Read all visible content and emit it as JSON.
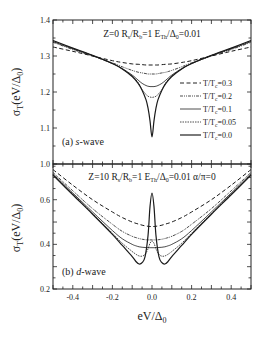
{
  "chart_data": [
    {
      "type": "line",
      "panel_label": "(a) s-wave",
      "annotation": "Z=0  Rs/Rb=1  ETh/Δ0=0.01",
      "xlabel": "eV/Δ0",
      "ylabel": "σT(eV/Δ0)",
      "xlim": [
        -0.5,
        0.5
      ],
      "ylim": [
        1.0,
        1.4
      ],
      "yticks": [
        "1.0",
        "1.1",
        "1.2",
        "1.3",
        "1.4"
      ],
      "grid": false,
      "legend_position": "right-center",
      "x": [
        -0.5,
        -0.4,
        -0.3,
        -0.2,
        -0.15,
        -0.1,
        -0.07,
        -0.05,
        -0.03,
        -0.02,
        -0.01,
        0.0,
        0.01,
        0.02,
        0.03,
        0.05,
        0.07,
        0.1,
        0.15,
        0.2,
        0.3,
        0.4,
        0.5
      ],
      "series": [
        {
          "name": "T/Tc=0.3",
          "style": "dashed",
          "values": [
            1.325,
            1.313,
            1.3,
            1.287,
            1.282,
            1.278,
            1.277,
            1.276,
            1.275,
            1.275,
            1.275,
            1.275,
            1.275,
            1.275,
            1.275,
            1.276,
            1.277,
            1.278,
            1.282,
            1.287,
            1.3,
            1.313,
            1.325
          ]
        },
        {
          "name": "T/Tc=0.2",
          "style": "dash-dot-dot",
          "values": [
            1.338,
            1.318,
            1.3,
            1.281,
            1.27,
            1.26,
            1.255,
            1.253,
            1.251,
            1.25,
            1.25,
            1.25,
            1.25,
            1.25,
            1.251,
            1.253,
            1.255,
            1.26,
            1.27,
            1.281,
            1.3,
            1.318,
            1.338
          ]
        },
        {
          "name": "T/Tc=0.1",
          "style": "solid-thin",
          "values": [
            1.34,
            1.32,
            1.301,
            1.279,
            1.265,
            1.247,
            1.233,
            1.224,
            1.218,
            1.216,
            1.215,
            1.215,
            1.215,
            1.216,
            1.218,
            1.224,
            1.233,
            1.247,
            1.265,
            1.279,
            1.301,
            1.32,
            1.34
          ]
        },
        {
          "name": "T/Tc=0.05",
          "style": "short-dash",
          "values": [
            1.342,
            1.321,
            1.301,
            1.279,
            1.264,
            1.244,
            1.226,
            1.207,
            1.193,
            1.188,
            1.186,
            1.185,
            1.186,
            1.188,
            1.193,
            1.207,
            1.226,
            1.244,
            1.264,
            1.279,
            1.301,
            1.321,
            1.342
          ]
        },
        {
          "name": "T/Tc=0.0",
          "style": "solid",
          "values": [
            1.343,
            1.322,
            1.302,
            1.279,
            1.264,
            1.243,
            1.224,
            1.205,
            1.178,
            1.155,
            1.12,
            1.075,
            1.12,
            1.155,
            1.178,
            1.205,
            1.224,
            1.243,
            1.264,
            1.279,
            1.302,
            1.322,
            1.343
          ]
        }
      ]
    },
    {
      "type": "line",
      "panel_label": "(b) d-wave",
      "annotation": "Z=10  Rs/Rb=1  ETh/Δ0=0.01  α/π=0",
      "xlabel": "eV/Δ0",
      "ylabel": "σT(eV/Δ0)",
      "xlim": [
        -0.5,
        0.5
      ],
      "ylim": [
        0.2,
        0.76
      ],
      "xticks": [
        "-0.4",
        "-0.2",
        "0.0",
        "0.2",
        "0.4"
      ],
      "yticks": [
        "0.2",
        "0.4",
        "0.6"
      ],
      "grid": false,
      "x": [
        -0.5,
        -0.4,
        -0.3,
        -0.2,
        -0.15,
        -0.1,
        -0.08,
        -0.065,
        -0.05,
        -0.035,
        -0.02,
        -0.01,
        0.0,
        0.01,
        0.02,
        0.035,
        0.05,
        0.065,
        0.08,
        0.1,
        0.15,
        0.2,
        0.3,
        0.4,
        0.5
      ],
      "series": [
        {
          "name": "T/Tc=0.3",
          "style": "dashed",
          "values": [
            0.735,
            0.665,
            0.6,
            0.545,
            0.52,
            0.5,
            0.494,
            0.49,
            0.486,
            0.483,
            0.481,
            0.48,
            0.48,
            0.48,
            0.481,
            0.483,
            0.486,
            0.49,
            0.494,
            0.5,
            0.52,
            0.545,
            0.6,
            0.665,
            0.735
          ]
        },
        {
          "name": "T/Tc=0.2",
          "style": "dash-dot-dot",
          "values": [
            0.722,
            0.64,
            0.56,
            0.49,
            0.458,
            0.436,
            0.43,
            0.426,
            0.423,
            0.421,
            0.42,
            0.42,
            0.42,
            0.42,
            0.42,
            0.421,
            0.423,
            0.426,
            0.43,
            0.436,
            0.458,
            0.49,
            0.56,
            0.64,
            0.722
          ]
        },
        {
          "name": "T/Tc=0.1",
          "style": "solid-thin",
          "values": [
            0.716,
            0.63,
            0.545,
            0.462,
            0.425,
            0.4,
            0.393,
            0.389,
            0.387,
            0.386,
            0.385,
            0.385,
            0.385,
            0.385,
            0.385,
            0.386,
            0.387,
            0.389,
            0.393,
            0.4,
            0.425,
            0.462,
            0.545,
            0.63,
            0.716
          ]
        },
        {
          "name": "T/Tc=0.05",
          "style": "short-dash",
          "values": [
            0.712,
            0.625,
            0.538,
            0.45,
            0.405,
            0.368,
            0.355,
            0.348,
            0.347,
            0.355,
            0.38,
            0.405,
            0.415,
            0.405,
            0.38,
            0.355,
            0.347,
            0.348,
            0.355,
            0.368,
            0.405,
            0.45,
            0.538,
            0.625,
            0.712
          ]
        },
        {
          "name": "T/Tc=0.0",
          "style": "solid",
          "values": [
            0.71,
            0.622,
            0.535,
            0.445,
            0.395,
            0.345,
            0.322,
            0.312,
            0.318,
            0.345,
            0.44,
            0.57,
            0.63,
            0.57,
            0.44,
            0.345,
            0.318,
            0.312,
            0.322,
            0.345,
            0.395,
            0.445,
            0.535,
            0.622,
            0.71
          ]
        }
      ]
    }
  ],
  "figure": {
    "top_annotation_parts": [
      "Z=0 R",
      "s",
      "/R",
      "b",
      "=1  E",
      "Th",
      "/Δ",
      "0",
      "=0.01"
    ],
    "bottom_annotation_parts": [
      "Z=10 R",
      "s",
      "/R",
      "b",
      "=1  E",
      "Th",
      "/Δ",
      "0",
      "=0.01  α/π=0"
    ],
    "top_panel_label": "(a) ",
    "top_panel_label_italic": "s",
    "top_panel_label_rest": "-wave",
    "bottom_panel_label": "(b) ",
    "bottom_panel_label_italic": "d",
    "bottom_panel_label_rest": "-wave",
    "ylabel_main": "σ",
    "ylabel_sub": "T",
    "ylabel_rest": "(eV/Δ",
    "ylabel_sub2": "0",
    "ylabel_end": ")",
    "xlabel_main": "eV/Δ",
    "xlabel_sub": "0",
    "legend": [
      {
        "label": "T/T",
        "sub": "c",
        "val": "=0.3"
      },
      {
        "label": "T/T",
        "sub": "c",
        "val": "=0.2"
      },
      {
        "label": "T/T",
        "sub": "c",
        "val": "=0.1"
      },
      {
        "label": "T/T",
        "sub": "c",
        "val": "=0.05"
      },
      {
        "label": "T/T",
        "sub": "c",
        "val": "=0.0"
      }
    ],
    "line_color": "#1a1a1a"
  }
}
